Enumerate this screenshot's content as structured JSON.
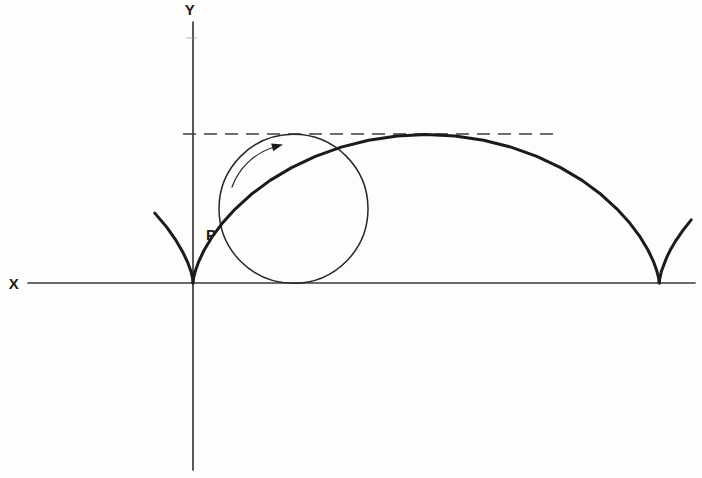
{
  "figure": {
    "colors": {
      "ink": "#1b1b1b",
      "background": "#fdfdfb"
    },
    "labels": {
      "y_axis": "Y",
      "x_axis": "X",
      "point": "P"
    }
  }
}
